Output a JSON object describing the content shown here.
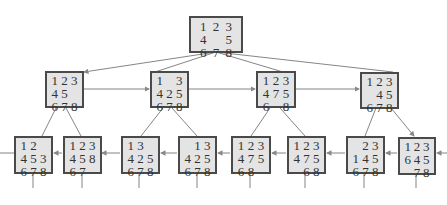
{
  "diagram": {
    "root": {
      "id": "root",
      "tiles": [
        "1",
        "2",
        "3",
        "4",
        "",
        "5",
        "6",
        "7",
        "8"
      ]
    },
    "level1": [
      {
        "id": "n1",
        "tiles": [
          "1",
          "2",
          "3",
          "4",
          "5",
          "",
          "6",
          "7",
          "8"
        ]
      },
      {
        "id": "n2",
        "tiles": [
          "1",
          "",
          "3",
          "4",
          "2",
          "5",
          "6",
          "7",
          "8"
        ]
      },
      {
        "id": "n3",
        "tiles": [
          "1",
          "2",
          "3",
          "4",
          "7",
          "5",
          "6",
          "",
          "8"
        ]
      },
      {
        "id": "n4",
        "tiles": [
          "1",
          "2",
          "3",
          "",
          "4",
          "5",
          "6",
          "7",
          "8"
        ]
      }
    ],
    "level2": [
      {
        "id": "n5",
        "tiles": [
          "1",
          "2",
          "",
          "4",
          "5",
          "3",
          "6",
          "7",
          "8"
        ]
      },
      {
        "id": "n6",
        "tiles": [
          "1",
          "2",
          "3",
          "4",
          "5",
          "8",
          "6",
          "7",
          ""
        ]
      },
      {
        "id": "n7",
        "tiles": [
          "1",
          "3",
          "",
          "4",
          "2",
          "5",
          "6",
          "7",
          "8"
        ]
      },
      {
        "id": "n8",
        "tiles": [
          "",
          "1",
          "3",
          "4",
          "2",
          "5",
          "6",
          "7",
          "8"
        ]
      },
      {
        "id": "n9",
        "tiles": [
          "1",
          "2",
          "3",
          "4",
          "7",
          "5",
          "6",
          "8",
          ""
        ]
      },
      {
        "id": "n10",
        "tiles": [
          "1",
          "2",
          "3",
          "4",
          "7",
          "5",
          "",
          "6",
          "8"
        ]
      },
      {
        "id": "n11",
        "tiles": [
          "",
          "2",
          "3",
          "1",
          "4",
          "5",
          "6",
          "7",
          "8"
        ]
      },
      {
        "id": "n12",
        "tiles": [
          "1",
          "2",
          "3",
          "6",
          "4",
          "5",
          "",
          "7",
          "8"
        ]
      }
    ],
    "edge_color": "#777777",
    "node_fill": "#e4e4e4",
    "node_border": "#4a4a4a"
  }
}
